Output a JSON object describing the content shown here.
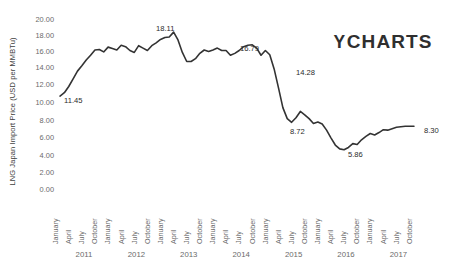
{
  "logo": {
    "symbol": "Y",
    "text": "CHARTS",
    "color": "#2f2f2f"
  },
  "chart_data": {
    "type": "line",
    "title": "",
    "xlabel": "",
    "ylabel": "LNG Japan Import Price (USD per MMBTu)",
    "ylim": [
      0.0,
      20.0
    ],
    "ytick_labels": [
      "20.00",
      "18.00",
      "16.00",
      "14.00",
      "12.00",
      "10.00",
      "8.00",
      "6.00",
      "4.00",
      "2.00",
      "0.00"
    ],
    "ytick_values": [
      20.0,
      18.0,
      16.0,
      14.0,
      12.0,
      10.0,
      8.0,
      6.0,
      4.0,
      2.0,
      0.0
    ],
    "grid": false,
    "legend": "none",
    "line_color": "#333333",
    "line_width": 1.6,
    "xtick_labels": [
      "January",
      "April",
      "July",
      "October",
      "January",
      "April",
      "July",
      "October",
      "January",
      "April",
      "July",
      "October",
      "January",
      "April",
      "July",
      "October",
      "January",
      "April",
      "July",
      "October",
      "January",
      "April",
      "July",
      "October",
      "January",
      "April",
      "July",
      "October"
    ],
    "year_labels": [
      "2011",
      "2012",
      "2013",
      "2014",
      "2015",
      "2016",
      "2017"
    ],
    "x": [
      "2011-01",
      "2011-02",
      "2011-03",
      "2011-04",
      "2011-05",
      "2011-06",
      "2011-07",
      "2011-08",
      "2011-09",
      "2011-10",
      "2011-11",
      "2011-12",
      "2012-01",
      "2012-02",
      "2012-03",
      "2012-04",
      "2012-05",
      "2012-06",
      "2012-07",
      "2012-08",
      "2012-09",
      "2012-10",
      "2012-11",
      "2012-12",
      "2013-01",
      "2013-02",
      "2013-03",
      "2013-04",
      "2013-05",
      "2013-06",
      "2013-07",
      "2013-08",
      "2013-09",
      "2013-10",
      "2013-11",
      "2013-12",
      "2014-01",
      "2014-02",
      "2014-03",
      "2014-04",
      "2014-05",
      "2014-06",
      "2014-07",
      "2014-08",
      "2014-09",
      "2014-10",
      "2014-11",
      "2014-12",
      "2015-01",
      "2015-02",
      "2015-03",
      "2015-04",
      "2015-05",
      "2015-06",
      "2015-07",
      "2015-08",
      "2015-09",
      "2015-10",
      "2015-11",
      "2015-12",
      "2016-01",
      "2016-02",
      "2016-03",
      "2016-04",
      "2016-05",
      "2016-06",
      "2016-07",
      "2016-08",
      "2016-09",
      "2016-10",
      "2016-11",
      "2016-12",
      "2017-01",
      "2017-02",
      "2017-03",
      "2017-04",
      "2017-05",
      "2017-06",
      "2017-07",
      "2017-08",
      "2017-09",
      "2017-10"
    ],
    "values": [
      11.45,
      11.8,
      12.45,
      13.25,
      14.05,
      14.6,
      15.2,
      15.7,
      16.25,
      16.3,
      16.05,
      16.55,
      16.4,
      16.25,
      16.75,
      16.6,
      16.2,
      16.0,
      16.7,
      16.45,
      16.2,
      16.7,
      17.0,
      17.35,
      17.55,
      17.6,
      18.11,
      17.3,
      16.0,
      15.05,
      15.05,
      15.35,
      15.9,
      16.25,
      16.1,
      16.25,
      16.45,
      16.2,
      16.2,
      15.7,
      15.9,
      16.2,
      16.6,
      16.75,
      16.79,
      16.45,
      15.7,
      16.2,
      15.75,
      14.28,
      12.3,
      10.25,
      9.1,
      8.72,
      9.2,
      9.85,
      9.5,
      9.1,
      8.6,
      8.75,
      8.55,
      7.9,
      7.1,
      6.35,
      5.95,
      5.86,
      6.1,
      6.5,
      6.4,
      6.9,
      7.25,
      7.55,
      7.4,
      7.65,
      7.95,
      7.9,
      8.05,
      8.2,
      8.25,
      8.3,
      8.3,
      8.3
    ],
    "point_labels": [
      {
        "label": "11.45",
        "value": 11.45,
        "x_index": 0,
        "px": 64,
        "py": 96
      },
      {
        "label": "18.11",
        "value": 18.11,
        "x_index": 26,
        "px": 156,
        "py": 24
      },
      {
        "label": "16.79",
        "value": 16.79,
        "x_index": 44,
        "px": 240,
        "py": 44
      },
      {
        "label": "14.28",
        "value": 14.28,
        "x_index": 49,
        "px": 296,
        "py": 68
      },
      {
        "label": "8.72",
        "value": 8.72,
        "x_index": 53,
        "px": 290,
        "py": 127
      },
      {
        "label": "5.86",
        "value": 5.86,
        "x_index": 65,
        "px": 348,
        "py": 150
      },
      {
        "label": "8.30",
        "value": 8.3,
        "x_index": 79,
        "px": 424,
        "py": 126
      }
    ]
  }
}
